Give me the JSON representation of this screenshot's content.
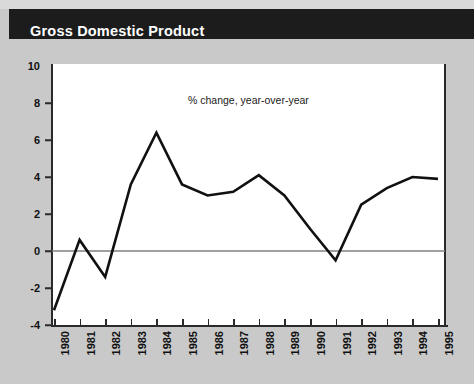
{
  "header": {
    "title": "Gross Domestic Product"
  },
  "colors": {
    "header_bg": "#1c1c1c",
    "header_text": "#ffffff",
    "page_bg": "#c9c9c9",
    "plot_bg": "#ffffff",
    "line": "#111111",
    "axis": "#2a2a2a",
    "zero_line": "#808080"
  },
  "chart_data": {
    "type": "line",
    "title": "Gross Domestic Product",
    "annotation": "% change, year-over-year",
    "xlabel": "",
    "ylabel": "",
    "x": [
      1980,
      1981,
      1982,
      1983,
      1984,
      1985,
      1986,
      1987,
      1988,
      1989,
      1990,
      1991,
      1992,
      1993,
      1994,
      1995
    ],
    "categories": [
      "1980",
      "1981",
      "1982",
      "1983",
      "1984",
      "1985",
      "1986",
      "1987",
      "1988",
      "1989",
      "1990",
      "1991",
      "1992",
      "1993",
      "1994",
      "1995"
    ],
    "values": [
      -3.2,
      0.6,
      -1.4,
      3.6,
      6.4,
      3.6,
      3.0,
      3.2,
      4.1,
      3.0,
      1.2,
      -0.5,
      2.5,
      3.4,
      4.0,
      3.9
    ],
    "series": [
      {
        "name": "% change, year-over-year",
        "values": [
          -3.2,
          0.6,
          -1.4,
          3.6,
          6.4,
          3.6,
          3.0,
          3.2,
          4.1,
          3.0,
          1.2,
          -0.5,
          2.5,
          3.4,
          4.0,
          3.9
        ]
      }
    ],
    "ylim": [
      -4,
      10
    ],
    "yticks": [
      10,
      8,
      6,
      4,
      2,
      0,
      -2,
      -4
    ],
    "ytick_labels": [
      "10",
      "8",
      "6",
      "4",
      "2",
      "0",
      "-2",
      "-4"
    ],
    "xlim": [
      1980,
      1995
    ],
    "grid": false,
    "zero_line": true,
    "legend": null
  }
}
